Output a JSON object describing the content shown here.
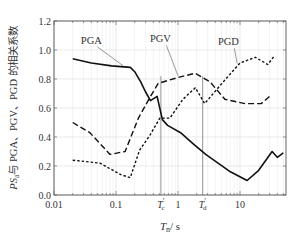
{
  "chart_data": {
    "type": "line",
    "title": "",
    "xlabel": "T_n / s",
    "xlabel_main": "T",
    "xlabel_sub": "n",
    "xlabel_unit": "/ s",
    "ylabel": "PS_a 与 PGA、PGV、PGD 的相关系数",
    "ylabel_prefix": "PS",
    "ylabel_sub": "a",
    "ylabel_rest": "与 PGA、PGV、PGD 的相关系数",
    "xscale": "log",
    "xlim": [
      0.01,
      55
    ],
    "ylim": [
      0.0,
      1.2
    ],
    "grid": true,
    "x_ticks": [
      {
        "value": 0.01,
        "label": "0.01"
      },
      {
        "value": 0.1,
        "label": "0.1"
      },
      {
        "value": 1,
        "label": "1"
      },
      {
        "value": 10,
        "label": "10"
      }
    ],
    "y_ticks": [
      {
        "value": 0.0,
        "label": "0.0"
      },
      {
        "value": 0.2,
        "label": "0.2"
      },
      {
        "value": 0.4,
        "label": "0.4"
      },
      {
        "value": 0.6,
        "label": "0.6"
      },
      {
        "value": 0.8,
        "label": "0.8"
      },
      {
        "value": 1.0,
        "label": "1.0"
      },
      {
        "value": 1.2,
        "label": "1.2"
      }
    ],
    "vertical_markers": [
      {
        "name": "Tc'",
        "label_main": "T",
        "label_sub": "c",
        "label_prime": "′",
        "x": 0.53
      },
      {
        "name": "Td'",
        "label_main": "T",
        "label_sub": "d",
        "label_prime": "′",
        "x": 2.5
      }
    ],
    "series": [
      {
        "name": "PGA",
        "style": "solid",
        "x": [
          0.02,
          0.04,
          0.085,
          0.17,
          0.2,
          0.25,
          0.3,
          0.36,
          0.46,
          0.56,
          0.68,
          1.1,
          1.8,
          2.8,
          7,
          13,
          20,
          33,
          40,
          50
        ],
        "y": [
          0.94,
          0.91,
          0.89,
          0.88,
          0.85,
          0.78,
          0.71,
          0.65,
          0.68,
          0.52,
          0.48,
          0.43,
          0.35,
          0.28,
          0.16,
          0.1,
          0.17,
          0.3,
          0.26,
          0.29
        ]
      },
      {
        "name": "PGV",
        "style": "long-dash",
        "x": [
          0.02,
          0.038,
          0.08,
          0.14,
          0.23,
          0.35,
          0.48,
          1.0,
          1.9,
          3.3,
          5.7,
          12,
          22,
          30
        ],
        "y": [
          0.5,
          0.43,
          0.28,
          0.3,
          0.53,
          0.67,
          0.77,
          0.81,
          0.84,
          0.78,
          0.66,
          0.63,
          0.63,
          0.68
        ]
      },
      {
        "name": "PGD",
        "style": "short-dash",
        "x": [
          0.02,
          0.055,
          0.12,
          0.17,
          0.24,
          0.35,
          0.51,
          0.74,
          1.2,
          1.9,
          2.7,
          5.1,
          10,
          17.7,
          28,
          36
        ],
        "y": [
          0.24,
          0.22,
          0.14,
          0.12,
          0.31,
          0.41,
          0.53,
          0.53,
          0.66,
          0.74,
          0.63,
          0.77,
          0.91,
          0.95,
          0.9,
          0.96
        ]
      }
    ],
    "annotations": [
      {
        "text": "PGA",
        "text_x": 0.04,
        "text_y": 1.07,
        "arrow_to_x": 0.13,
        "arrow_to_y": 0.885
      },
      {
        "text": "PGV",
        "text_x": 0.52,
        "text_y": 1.08,
        "arrow_to_x": 1.0,
        "arrow_to_y": 0.815
      },
      {
        "text": "PGD",
        "text_x": 6.5,
        "text_y": 1.06,
        "arrow_to_x": 9.0,
        "arrow_to_y": 0.9
      }
    ],
    "legend": "none (inline annotations)"
  }
}
